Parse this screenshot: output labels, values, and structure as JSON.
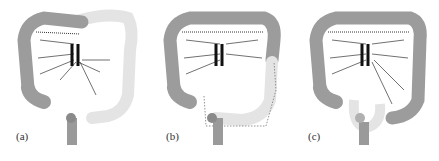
{
  "figure": {
    "panels": [
      {
        "label": "(a)",
        "description": "Colon with left half (distal transverse, descending, sigmoid) faded; mesenteric vessels shown"
      },
      {
        "label": "(b)",
        "description": "Colon with left colon faded and dotted outline indicating resection region extending to sigmoid"
      },
      {
        "label": "(c)",
        "description": "Colon mostly intact; sigmoid/rectal region faded"
      }
    ],
    "colors": {
      "colon": "#9a9a9a",
      "colon_faded": "#e6e6e6",
      "vessel": "#222222",
      "aorta": "#1a1a1a"
    }
  }
}
